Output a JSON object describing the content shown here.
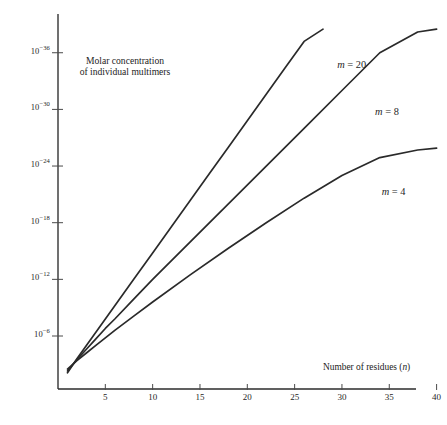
{
  "figure": {
    "caption_line1": "Molar concentration",
    "caption_line2": "of individual multimers",
    "background_color": "#ffffff",
    "ink_color": "#2a2a2a"
  },
  "chart_data": {
    "type": "line",
    "title": "",
    "subtitle": "",
    "caption": "Molar concentration of individual multimers",
    "xlabel": "Number of residues (n)",
    "xlabel_plain": "Number of residues",
    "xlabel_symbol": "n",
    "ylabel": "Molar concentration of individual multimers",
    "x_scale": "linear",
    "y_scale": "log",
    "grid": false,
    "legend": "inline-curve-labels",
    "legend_position": "right-of-curves",
    "xlim": [
      0,
      41
    ],
    "x_ticks": [
      5,
      10,
      15,
      20,
      25,
      30,
      35,
      40
    ],
    "x_tick_labels": [
      "5",
      "10",
      "15",
      "20",
      "25",
      "30",
      "35",
      "40"
    ],
    "y_ticks_exponents": [
      -6,
      -12,
      -18,
      -24,
      -30,
      -36
    ],
    "y_tick_labels": [
      "10−6",
      "10−12",
      "10−18",
      "10−24",
      "10−30",
      "10−36"
    ],
    "y_tick_mantissa": "10",
    "y_tick_exponents_text": [
      "-6",
      "-12",
      "-18",
      "-24",
      "-30",
      "-36"
    ],
    "ylim_exponents": [
      -2,
      -38
    ],
    "note": "y axis exponent decreases upward; values plotted as log10(concentration)",
    "series": [
      {
        "name": "m = 20",
        "label_text": "m = 20",
        "label_symbol": "m",
        "label_value": "= 20",
        "m": 20,
        "x": [
          1,
          2,
          3,
          4,
          5,
          6,
          8,
          10,
          12,
          14,
          16,
          18,
          20,
          22,
          24,
          26,
          28
        ],
        "y_log10": [
          -2.1,
          -3.6,
          -5.0,
          -6.4,
          -7.8,
          -9.2,
          -12.0,
          -14.8,
          -17.6,
          -20.4,
          -23.2,
          -26.0,
          -28.8,
          -31.6,
          -34.4,
          -37.2,
          -38.5
        ],
        "label_x": 29.5,
        "label_y_log10": -34.6
      },
      {
        "name": "m = 8",
        "label_text": "m = 8",
        "label_symbol": "m",
        "label_value": "= 8",
        "m": 8,
        "x": [
          1,
          2,
          3,
          4,
          5,
          6,
          8,
          10,
          14,
          18,
          22,
          26,
          30,
          34,
          38,
          40
        ],
        "y_log10": [
          -2.3,
          -3.5,
          -4.6,
          -5.7,
          -6.8,
          -7.8,
          -9.9,
          -12.0,
          -16.0,
          -20.0,
          -24.0,
          -28.0,
          -32.0,
          -36.0,
          -38.2,
          -38.5
        ],
        "label_x": 33.5,
        "label_y_log10": -29.6
      },
      {
        "name": "m = 4",
        "label_text": "m = 4",
        "label_symbol": "m",
        "label_value": "= 4",
        "m": 4,
        "x": [
          1,
          2,
          3,
          4,
          5,
          6,
          8,
          10,
          14,
          18,
          22,
          26,
          30,
          34,
          38,
          40
        ],
        "y_log10": [
          -2.5,
          -3.4,
          -4.2,
          -5.0,
          -5.8,
          -6.6,
          -8.1,
          -9.6,
          -12.5,
          -15.3,
          -18.0,
          -20.6,
          -23.0,
          -24.9,
          -25.7,
          -25.9
        ],
        "label_x": 34.2,
        "label_y_log10": -21.2
      }
    ]
  }
}
